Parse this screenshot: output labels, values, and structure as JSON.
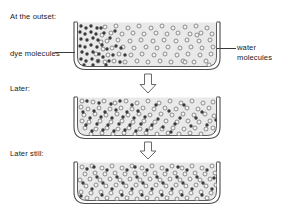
{
  "diagram": {
    "stages": [
      {
        "id": "stage-outset",
        "label": "At the outset:",
        "description": "Dye molecules concentrated at the left side of the vessel",
        "dye_distribution": "left-clustered"
      },
      {
        "id": "stage-later",
        "label": "Later:",
        "description": "Dye molecules partially spread toward the right",
        "dye_distribution": "partially-mixed"
      },
      {
        "id": "stage-later-still",
        "label": "Later still:",
        "description": "Dye molecules evenly distributed throughout the water",
        "dye_distribution": "uniform"
      }
    ],
    "callouts": [
      {
        "id": "callout-dye",
        "label": "dye molecules",
        "points_to": "dark filled circles at left of first vessel"
      },
      {
        "id": "callout-water",
        "label": "water molecules",
        "lines": [
          "water",
          "molecules"
        ],
        "points_to": "open circles throughout first vessel"
      }
    ],
    "arrows": [
      {
        "id": "arrow-1",
        "direction": "down",
        "style": "hollow-outline"
      },
      {
        "id": "arrow-2",
        "direction": "down",
        "style": "hollow-outline"
      }
    ],
    "colors": {
      "background": "#ffffff",
      "vessel_fill": "#e9e9e9",
      "vessel_stroke": "#3f3f3f",
      "dye_molecule": "#3a3a3a",
      "water_molecule_stroke": "#6e6e6e",
      "water_molecule_fill": "#f2f2f2",
      "text": "#1a1a1a",
      "arrow_stroke": "#6a6a6a",
      "arrow_fill": "#fbfbfb"
    }
  },
  "chart_data": {
    "type": "diagram",
    "stages": [
      "At the outset:",
      "Later:",
      "Later still:"
    ],
    "dye_left_fraction": [
      0.95,
      0.6,
      0.5
    ]
  }
}
